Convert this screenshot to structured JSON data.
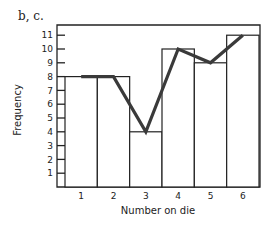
{
  "figure": {
    "part_label": "b, c.",
    "colors": {
      "axis": "#222222",
      "bar_stroke": "#222222",
      "bar_fill": "#ffffff",
      "polygon": "#3a3a3a"
    }
  },
  "chart_data": {
    "type": "bar",
    "subtype": "histogram with frequency polygon",
    "title": "",
    "xlabel": "Number on die",
    "ylabel": "Frequency",
    "categories": [
      "1",
      "2",
      "3",
      "4",
      "5",
      "6"
    ],
    "values": [
      8,
      8,
      4,
      10,
      9,
      11
    ],
    "series": [
      {
        "name": "histogram",
        "type": "bar",
        "values": [
          8,
          8,
          4,
          10,
          9,
          11
        ]
      },
      {
        "name": "frequency polygon",
        "type": "line",
        "values": [
          8,
          8,
          4,
          10,
          9,
          11
        ]
      }
    ],
    "yticks": [
      1,
      2,
      3,
      4,
      5,
      6,
      7,
      8,
      9,
      10,
      11
    ],
    "ylim": [
      0,
      12
    ],
    "grid": false,
    "legend": null
  }
}
